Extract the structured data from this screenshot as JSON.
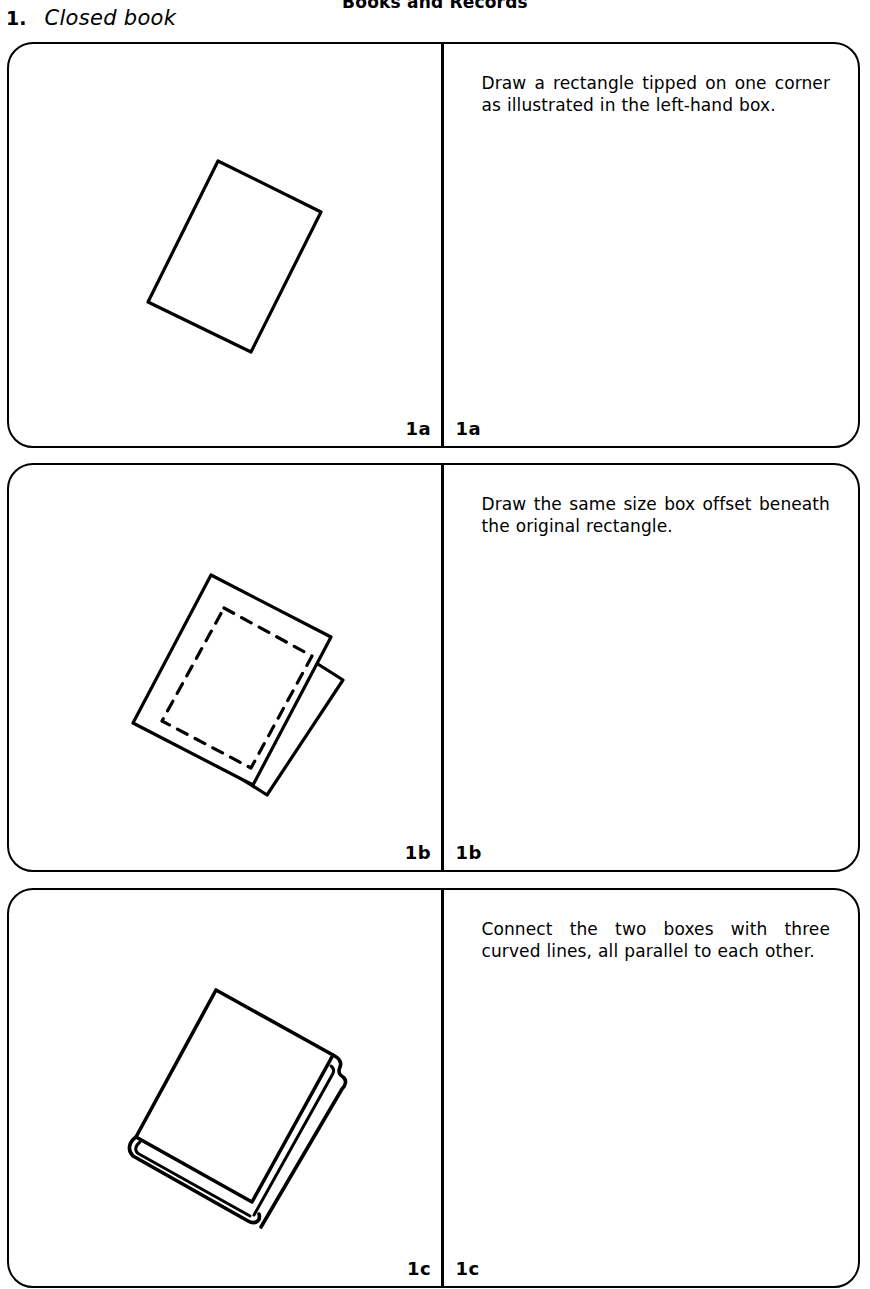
{
  "page": {
    "running_head": "Books and Records",
    "section_number": "1.",
    "section_name": "Closed book"
  },
  "panels": [
    {
      "figure_label": "1a",
      "instruction_label": "1a",
      "instruction": "Draw a rectangle tipped on one corner as illustrated in the left-hand box."
    },
    {
      "figure_label": "1b",
      "instruction_label": "1b",
      "instruction": "Draw the same size box offset beneath the original rectangle."
    },
    {
      "figure_label": "1c",
      "instruction_label": "1c",
      "instruction": "Connect the two boxes with three curved lines, all parallel to each other."
    }
  ],
  "figures": {
    "step_1a": {
      "name": "tipped-rectangle",
      "cover_points": "209,117 312,168 242,308 139,258",
      "stroke_width": 3.2
    },
    "step_1b": {
      "name": "tipped-rectangle-with-offset-box",
      "top_cover_points": "202,110 322,172 244,320 124,258",
      "dashed_points": "215,143 303,191 242,303 153,256",
      "offset_cover_points": "232,150 334,215 258,330 156,265",
      "stroke_width": 3.2,
      "dash_pattern": "11 9"
    },
    "step_1c": {
      "name": "finished-closed-book",
      "cover_points": "207,100 324,165 243,312 127,247",
      "spine_outer": "127,247 121,258 129,268 243,331 249,325 243,312",
      "page_edge": "324,165 334,175 329,184 334,192 330,200 251,336 243,331",
      "stroke_width": 3.6
    }
  },
  "colors": {
    "ink": "#000000",
    "paper": "#ffffff"
  }
}
